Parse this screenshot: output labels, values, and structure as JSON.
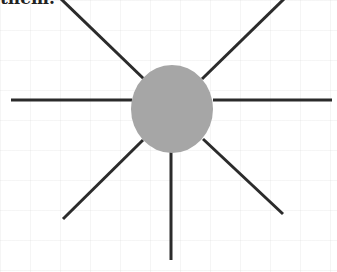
{
  "caption": "them.",
  "diagram": {
    "type": "sunburst-rays",
    "center": {
      "x": 172,
      "y": 109,
      "rx": 41,
      "ry": 44,
      "fill": "#a6a6a6"
    },
    "line_color": "#2b2b2b",
    "rays": [
      {
        "x1": 60,
        "y1": -2,
        "x2": 145,
        "y2": 80
      },
      {
        "x1": 285,
        "y1": -2,
        "x2": 202,
        "y2": 79
      },
      {
        "x1": 11,
        "y1": 100,
        "x2": 132,
        "y2": 100
      },
      {
        "x1": 213,
        "y1": 100,
        "x2": 332,
        "y2": 100
      },
      {
        "x1": 143,
        "y1": 140,
        "x2": 63,
        "y2": 219
      },
      {
        "x1": 203,
        "y1": 139,
        "x2": 283,
        "y2": 214
      },
      {
        "x1": 171,
        "y1": 152,
        "x2": 171,
        "y2": 260
      }
    ]
  }
}
